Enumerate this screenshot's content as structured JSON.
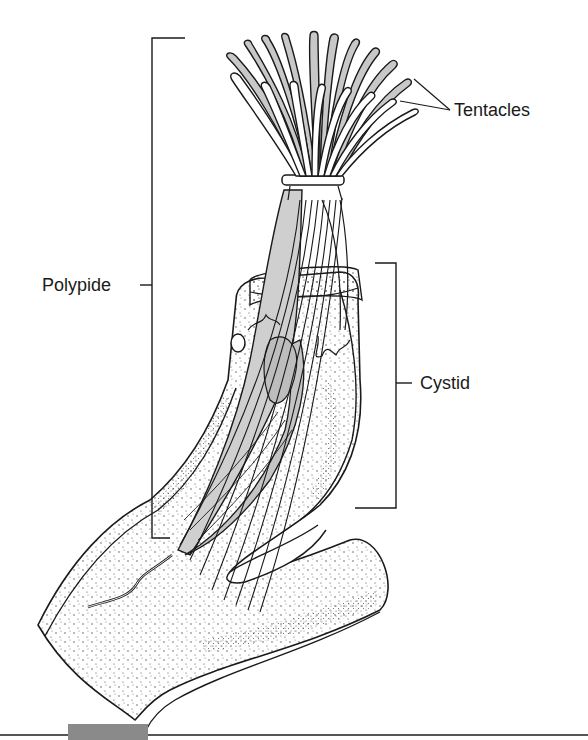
{
  "figure": {
    "labels": {
      "tentacles": "Tentacles",
      "polypide": "Polypide",
      "cystid": "Cystid"
    },
    "colors": {
      "line": "#1a1a1a",
      "tentacle_fill": "#c8c8c8",
      "body_fill": "#d9d9d9",
      "stipple": "#444444",
      "background": "#ffffff",
      "footer_tab": "#8a8a8a",
      "footer_rule": "#555555"
    },
    "brackets": {
      "polypide": {
        "x": 152,
        "top": 38,
        "bottom": 538,
        "tick_y": 285
      },
      "cystid": {
        "x": 396,
        "top": 263,
        "bottom": 508,
        "tick_y": 383
      }
    }
  }
}
